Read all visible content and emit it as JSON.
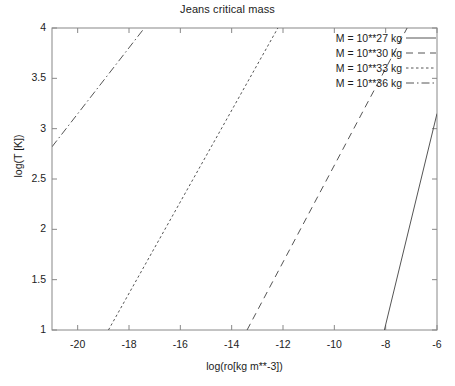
{
  "chart_data": {
    "type": "line",
    "title": "Jeans critical mass",
    "xlabel": "log(ro[kg m**-3])",
    "ylabel": "log(T [K])",
    "xlim": [
      -21,
      -6
    ],
    "ylim": [
      1,
      4
    ],
    "xticks": [
      -20,
      -18,
      -16,
      -14,
      -12,
      -10,
      -8,
      -6
    ],
    "yticks": [
      1,
      1.5,
      2,
      2.5,
      3,
      3.5,
      4
    ],
    "xtick_labels": [
      "-20",
      "-18",
      "-16",
      "-14",
      "-12",
      "-10",
      "-8",
      "-6"
    ],
    "ytick_labels": [
      "1",
      "1.5",
      "2",
      "2.5",
      "3",
      "3.5",
      "4"
    ],
    "grid": false,
    "legend_position": "top-right",
    "line_color": "#555555",
    "frame_color": "#888888",
    "series": [
      {
        "name": "M = 10**27 kg",
        "dash": "solid",
        "x": [
          -8.05,
          -6.0
        ],
        "y": [
          1.0,
          3.15
        ]
      },
      {
        "name": "M = 10**30 kg",
        "dash": "dashed",
        "x": [
          -13.4,
          -6.0
        ],
        "y": [
          1.0,
          4.56
        ]
      },
      {
        "name": "M = 10**33 kg",
        "dash": "dotted",
        "x": [
          -18.8,
          -12.2
        ],
        "y": [
          1.0,
          4.0
        ]
      },
      {
        "name": "M = 10**36 kg",
        "dash": "dashdot",
        "x": [
          -21.0,
          -17.4
        ],
        "y": [
          2.82,
          4.0
        ]
      }
    ]
  },
  "legend": {
    "items": [
      {
        "label": "M = 10**27 kg",
        "dash": "solid"
      },
      {
        "label": "M = 10**30 kg",
        "dash": "dashed"
      },
      {
        "label": "M = 10**33 kg",
        "dash": "dotted"
      },
      {
        "label": "M = 10**36 kg",
        "dash": "dashdot"
      }
    ]
  }
}
